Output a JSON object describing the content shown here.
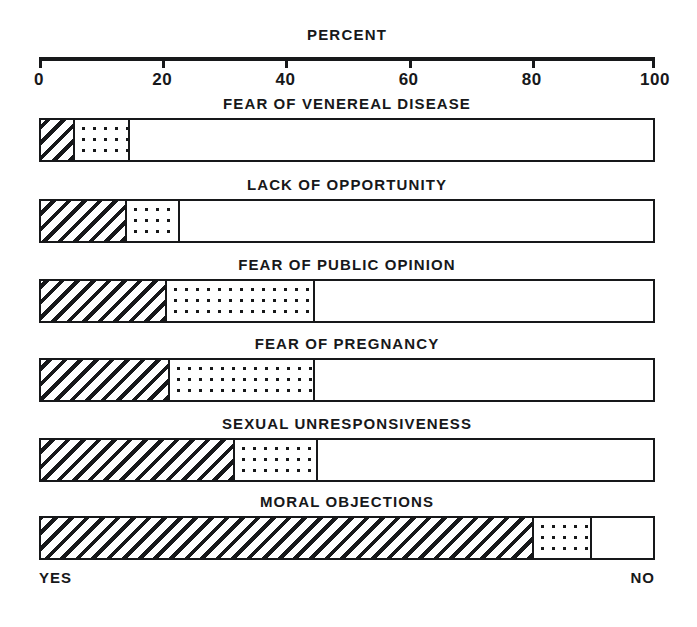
{
  "chart_data": {
    "type": "bar",
    "orientation": "horizontal",
    "stacked": true,
    "title": "PERCENT",
    "xlabel": "PERCENT",
    "ylabel": "",
    "xlim": [
      0,
      100
    ],
    "xticks": [
      0,
      20,
      40,
      60,
      80,
      100
    ],
    "xticklabels": [
      "0",
      "20",
      "40",
      "60",
      "80",
      "100"
    ],
    "grid": false,
    "legend": false,
    "axis_position": "top",
    "left_end_label": "YES",
    "right_end_label": "NO",
    "categories": [
      "FEAR OF VENEREAL DISEASE",
      "LACK OF OPPORTUNITY",
      "FEAR OF PUBLIC OPINION",
      "FEAR OF PREGNANCY",
      "SEXUAL UNRESPONSIVENESS",
      "MORAL OBJECTIONS"
    ],
    "series": [
      {
        "name": "YES",
        "pattern": "diagonal-hatch",
        "values": [
          5.5,
          14.0,
          20.5,
          21.0,
          31.5,
          80.0
        ]
      },
      {
        "name": "MIDDLE",
        "pattern": "dotted",
        "values": [
          9.0,
          8.5,
          24.0,
          23.5,
          13.5,
          9.5
        ]
      },
      {
        "name": "NO",
        "pattern": "blank",
        "values": [
          85.5,
          77.5,
          55.5,
          55.5,
          55.0,
          10.5
        ]
      }
    ],
    "colors": {
      "ink": "#17181a",
      "paper": "#ffffff"
    }
  },
  "rows": [
    {
      "label": "FEAR OF VENEREAL DISEASE",
      "yes": 5.5,
      "mid": 9.0,
      "no": 85.5,
      "yes_end": 5.5,
      "mid_end": 14.5
    },
    {
      "label": "LACK OF OPPORTUNITY",
      "yes": 14.0,
      "mid": 8.5,
      "no": 77.5,
      "yes_end": 14.0,
      "mid_end": 22.5
    },
    {
      "label": "FEAR OF PUBLIC OPINION",
      "yes": 20.5,
      "mid": 24.0,
      "no": 55.5,
      "yes_end": 20.5,
      "mid_end": 44.5
    },
    {
      "label": "FEAR OF PREGNANCY",
      "yes": 21.0,
      "mid": 23.5,
      "no": 55.5,
      "yes_end": 21.0,
      "mid_end": 44.5
    },
    {
      "label": "SEXUAL UNRESPONSIVENESS",
      "yes": 31.5,
      "mid": 13.5,
      "no": 55.0,
      "yes_end": 31.5,
      "mid_end": 45.0
    },
    {
      "label": "MORAL OBJECTIONS",
      "yes": 80.0,
      "mid": 9.5,
      "no": 10.5,
      "yes_end": 80.0,
      "mid_end": 89.5
    }
  ],
  "axis": {
    "title": "PERCENT",
    "ticks": [
      "0",
      "20",
      "40",
      "60",
      "80",
      "100"
    ]
  },
  "footer": {
    "yes": "YES",
    "no": "NO"
  }
}
